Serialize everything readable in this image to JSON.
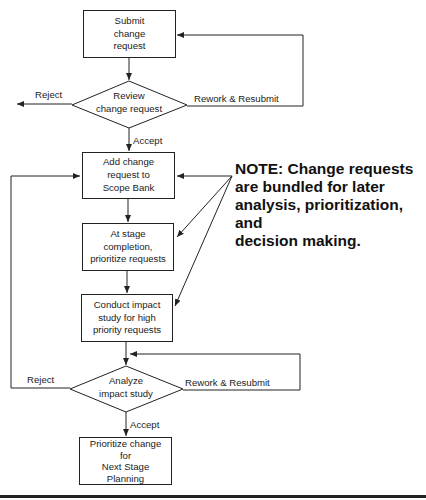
{
  "diagram": {
    "nodes": [
      {
        "id": "submit",
        "type": "process",
        "label_lines": [
          "Submit",
          "change",
          "request"
        ]
      },
      {
        "id": "review",
        "type": "decision",
        "label_lines": [
          "Review",
          "change request"
        ]
      },
      {
        "id": "add_scope_bank",
        "type": "process",
        "label_lines": [
          "Add change",
          "request to",
          "Scope Bank"
        ]
      },
      {
        "id": "prioritize_requests",
        "type": "process",
        "label_lines": [
          "At stage",
          "completion,",
          "prioritize requests"
        ]
      },
      {
        "id": "impact_study",
        "type": "process",
        "label_lines": [
          "Conduct impact",
          "study for high",
          "priority requests"
        ]
      },
      {
        "id": "analyze",
        "type": "decision",
        "label_lines": [
          "Analyze",
          "impact study"
        ]
      },
      {
        "id": "prioritize_change",
        "type": "process",
        "label_lines": [
          "Prioritize change",
          "for",
          "Next Stage",
          "Planning"
        ]
      }
    ],
    "edge_labels": {
      "review_reject": "Reject",
      "review_rework": "Rework & Resubmit",
      "review_accept": "Accept",
      "analyze_reject": "Reject",
      "analyze_rework": "Rework & Resubmit",
      "analyze_accept": "Accept"
    },
    "note": {
      "lines": [
        "NOTE: Change requests",
        "are bundled for later",
        "analysis, prioritization, and",
        "decision making."
      ]
    },
    "colors": {
      "line": "#222222",
      "background": "#ffffff"
    }
  }
}
